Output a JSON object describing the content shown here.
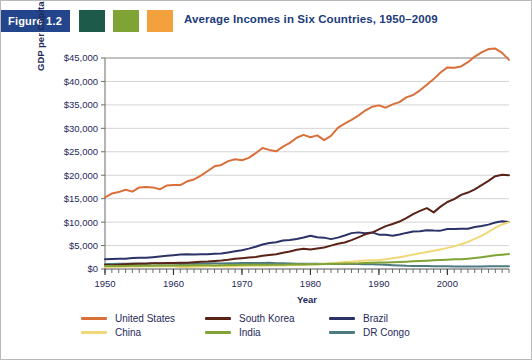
{
  "figure": {
    "badge_label": "Figure 1.2",
    "badge_color": "#23458c",
    "swatches": [
      {
        "name": "swatch-teal",
        "color": "#1d5a4a"
      },
      {
        "name": "swatch-green",
        "color": "#7fa435"
      },
      {
        "name": "swatch-orange",
        "color": "#f2a13c"
      }
    ],
    "title": "Average Incomes in Six Countries, 1950–2009"
  },
  "chart_data": {
    "type": "line",
    "title": "Average Incomes in Six Countries, 1950–2009",
    "xlabel": "Year",
    "ylabel": "GDP per Capita in US$, PPP",
    "xlim": [
      1950,
      2009
    ],
    "ylim": [
      0,
      45000
    ],
    "grid": true,
    "legend_position": "bottom",
    "ytick_labels": [
      "$0",
      "$5,000",
      "$10,000",
      "$15,000",
      "$20,000",
      "$25,000",
      "$30,000",
      "$35,000",
      "$40,000",
      "$45,000"
    ],
    "ytick_values": [
      0,
      5000,
      10000,
      15000,
      20000,
      25000,
      30000,
      35000,
      40000,
      45000
    ],
    "xtick_labels": [
      "1950",
      "1960",
      "1970",
      "1980",
      "1990",
      "2000"
    ],
    "xtick_values": [
      1950,
      1960,
      1970,
      1980,
      1990,
      2000
    ],
    "minor_xtick_interval": 1,
    "x": [
      1950,
      1951,
      1952,
      1953,
      1954,
      1955,
      1956,
      1957,
      1958,
      1959,
      1960,
      1961,
      1962,
      1963,
      1964,
      1965,
      1966,
      1967,
      1968,
      1969,
      1970,
      1971,
      1972,
      1973,
      1974,
      1975,
      1976,
      1977,
      1978,
      1979,
      1980,
      1981,
      1982,
      1983,
      1984,
      1985,
      1986,
      1987,
      1988,
      1989,
      1990,
      1991,
      1992,
      1993,
      1994,
      1995,
      1996,
      1997,
      1998,
      1999,
      2000,
      2001,
      2002,
      2003,
      2004,
      2005,
      2006,
      2007,
      2008,
      2009
    ],
    "series": [
      {
        "name": "United States",
        "color": "#d9703a",
        "values": [
          15300,
          16100,
          16400,
          16900,
          16500,
          17400,
          17500,
          17400,
          17000,
          17800,
          17900,
          17900,
          18700,
          19100,
          19900,
          20900,
          21900,
          22200,
          23000,
          23400,
          23200,
          23700,
          24700,
          25800,
          25400,
          25100,
          26100,
          26900,
          28000,
          28600,
          28100,
          28500,
          27500,
          28400,
          30100,
          31000,
          31800,
          32700,
          33800,
          34600,
          34900,
          34400,
          35100,
          35600,
          36600,
          37100,
          38100,
          39300,
          40500,
          41900,
          43000,
          42900,
          43200,
          44100,
          45300,
          46200,
          46900,
          47000,
          46100,
          44600
        ]
      },
      {
        "name": "China",
        "color": "#f0d879",
        "values": [
          450,
          460,
          500,
          520,
          530,
          550,
          590,
          600,
          550,
          580,
          560,
          430,
          440,
          480,
          540,
          580,
          610,
          570,
          550,
          600,
          650,
          670,
          680,
          710,
          720,
          750,
          730,
          780,
          840,
          900,
          960,
          1010,
          1100,
          1200,
          1350,
          1470,
          1570,
          1700,
          1820,
          1870,
          1920,
          2060,
          2280,
          2520,
          2790,
          3070,
          3350,
          3630,
          3880,
          4150,
          4500,
          4860,
          5280,
          5790,
          6410,
          7080,
          7900,
          8800,
          9500,
          10000
        ]
      },
      {
        "name": "South Korea",
        "color": "#5a2318",
        "values": [
          850,
          820,
          880,
          1020,
          1080,
          1130,
          1140,
          1210,
          1250,
          1280,
          1300,
          1330,
          1350,
          1450,
          1520,
          1580,
          1720,
          1820,
          1980,
          2180,
          2310,
          2450,
          2540,
          2830,
          3000,
          3140,
          3460,
          3740,
          4100,
          4320,
          4170,
          4380,
          4580,
          4980,
          5370,
          5640,
          6150,
          6760,
          7380,
          7760,
          8440,
          9150,
          9600,
          10120,
          10870,
          11690,
          12400,
          12980,
          12080,
          13300,
          14300,
          14900,
          15800,
          16300,
          17000,
          17900,
          18800,
          19800,
          20100,
          20000
        ]
      },
      {
        "name": "India",
        "color": "#7fa435",
        "values": [
          620,
          630,
          640,
          660,
          680,
          690,
          710,
          690,
          720,
          720,
          750,
          760,
          760,
          790,
          820,
          780,
          770,
          810,
          830,
          860,
          900,
          890,
          880,
          890,
          880,
          920,
          910,
          960,
          1000,
          940,
          990,
          1030,
          1050,
          1100,
          1130,
          1160,
          1190,
          1210,
          1290,
          1340,
          1400,
          1400,
          1450,
          1490,
          1550,
          1630,
          1720,
          1770,
          1840,
          1930,
          1990,
          2060,
          2080,
          2210,
          2360,
          2530,
          2720,
          2930,
          3050,
          3200
        ]
      },
      {
        "name": "Brazil",
        "color": "#2b3268",
        "values": [
          2100,
          2150,
          2180,
          2210,
          2320,
          2380,
          2380,
          2520,
          2680,
          2810,
          2940,
          3070,
          3150,
          3090,
          3130,
          3120,
          3240,
          3300,
          3540,
          3770,
          4000,
          4340,
          4730,
          5230,
          5550,
          5710,
          6070,
          6190,
          6400,
          6700,
          7080,
          6770,
          6690,
          6370,
          6690,
          7150,
          7650,
          7810,
          7630,
          7810,
          7330,
          7290,
          7100,
          7360,
          7700,
          7980,
          8050,
          8260,
          8200,
          8180,
          8510,
          8530,
          8590,
          8580,
          8960,
          9150,
          9460,
          9900,
          10200,
          10050
        ]
      },
      {
        "name": "DR Congo",
        "color": "#4d7a80",
        "values": [
          1050,
          1080,
          1100,
          1120,
          1150,
          1170,
          1190,
          1200,
          1180,
          1160,
          1190,
          1090,
          1120,
          1140,
          1160,
          1180,
          1200,
          1190,
          1220,
          1250,
          1270,
          1280,
          1290,
          1300,
          1310,
          1250,
          1200,
          1170,
          1130,
          1110,
          1120,
          1100,
          1070,
          1050,
          1070,
          1060,
          1070,
          1060,
          1030,
          1000,
          960,
          880,
          790,
          720,
          670,
          660,
          660,
          630,
          600,
          580,
          560,
          530,
          520,
          530,
          540,
          550,
          570,
          580,
          590,
          580
        ]
      }
    ]
  },
  "legend": {
    "items": [
      {
        "label": "United States",
        "color": "#d9703a"
      },
      {
        "label": "South Korea",
        "color": "#5a2318"
      },
      {
        "label": "Brazil",
        "color": "#2b3268"
      },
      {
        "label": "China",
        "color": "#f0d879"
      },
      {
        "label": "India",
        "color": "#7fa435"
      },
      {
        "label": "DR Congo",
        "color": "#4d7a80"
      }
    ]
  }
}
